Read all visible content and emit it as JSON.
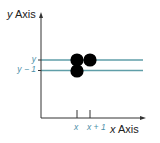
{
  "diagram": {
    "y_axis": {
      "var": "y",
      "word": "Axis"
    },
    "x_axis": {
      "var": "x",
      "word": "Axis"
    },
    "y_ticks": [
      {
        "label": "y",
        "pixel_y": 60
      },
      {
        "label": "y − 1",
        "pixel_y": 70
      }
    ],
    "x_ticks": [
      {
        "label": "x",
        "pixel_x": 77
      },
      {
        "label": "x + 1",
        "pixel_x": 90
      }
    ],
    "points": [
      {
        "col": "x",
        "row": "y"
      },
      {
        "col": "x + 1",
        "row": "y"
      },
      {
        "col": "x",
        "row": "y − 1"
      }
    ],
    "colors": {
      "axis": "#333333",
      "grid_line": "#5f9ea8",
      "tick_label": "#4a8fa8",
      "point": "#000000"
    }
  }
}
